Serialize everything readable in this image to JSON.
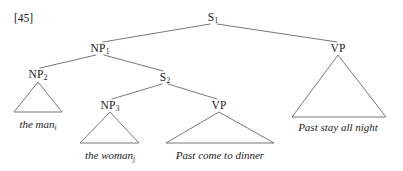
{
  "figure": {
    "example_number": "[45]",
    "caption": "",
    "line_color": "#55555a",
    "text_color": "#1a1a1a",
    "background_color": "#ffffff",
    "width": 403,
    "height": 171
  },
  "tree": {
    "type": "syntax-tree",
    "nodes": [
      {
        "id": "s1",
        "label": "S",
        "subscript": "1",
        "x": 213,
        "y": 17,
        "role": "root"
      },
      {
        "id": "np1",
        "label": "NP",
        "subscript": "1",
        "x": 100,
        "y": 48,
        "role": "branching"
      },
      {
        "id": "vp_right",
        "label": "VP",
        "subscript": "",
        "x": 338,
        "y": 48,
        "role": "triangle"
      },
      {
        "id": "np2",
        "label": "NP",
        "subscript": "2",
        "x": 38,
        "y": 74,
        "role": "triangle"
      },
      {
        "id": "s2",
        "label": "S",
        "subscript": "2",
        "x": 165,
        "y": 77,
        "role": "branching"
      },
      {
        "id": "np3",
        "label": "NP",
        "subscript": "3",
        "x": 110,
        "y": 105,
        "role": "triangle"
      },
      {
        "id": "vp_inner",
        "label": "VP",
        "subscript": "",
        "x": 219,
        "y": 105,
        "role": "triangle"
      }
    ],
    "edges": [
      {
        "from": "s1",
        "to": "np1",
        "x1": 210,
        "y1": 24,
        "x2": 103,
        "y2": 42
      },
      {
        "from": "s1",
        "to": "vp_right",
        "x1": 217,
        "y1": 24,
        "x2": 337,
        "y2": 42
      },
      {
        "from": "np1",
        "to": "np2",
        "x1": 96,
        "y1": 55,
        "x2": 40,
        "y2": 68
      },
      {
        "from": "np1",
        "to": "s2",
        "x1": 104,
        "y1": 55,
        "x2": 163,
        "y2": 71
      },
      {
        "from": "s2",
        "to": "np3",
        "x1": 162,
        "y1": 84,
        "x2": 112,
        "y2": 99
      },
      {
        "from": "s2",
        "to": "vp_inner",
        "x1": 168,
        "y1": 84,
        "x2": 217,
        "y2": 99
      }
    ],
    "triangles": [
      {
        "id": "tri_np2",
        "parent": "np2",
        "apex_x": 38,
        "apex_y": 82,
        "base_left_x": 14,
        "base_right_x": 62,
        "base_y": 112,
        "terminal": {
          "text": "the man",
          "subscript": "i",
          "x": 38,
          "y": 118
        }
      },
      {
        "id": "tri_np3",
        "parent": "np3",
        "apex_x": 110,
        "apex_y": 112,
        "base_left_x": 80,
        "base_right_x": 139,
        "base_y": 143,
        "terminal": {
          "text": "the woman",
          "subscript": "j",
          "x": 110,
          "y": 149
        }
      },
      {
        "id": "tri_vp_inner",
        "parent": "vp_inner",
        "apex_x": 219,
        "apex_y": 112,
        "base_left_x": 166,
        "base_right_x": 274,
        "base_y": 143,
        "terminal": {
          "text": "Past come to dinner",
          "subscript": "",
          "x": 220,
          "y": 149
        }
      },
      {
        "id": "tri_vp_right",
        "parent": "vp_right",
        "apex_x": 338,
        "apex_y": 55,
        "base_left_x": 292,
        "base_right_x": 386,
        "base_y": 117,
        "terminal": {
          "text": "Past stay all night",
          "subscript": "",
          "x": 338,
          "y": 121
        }
      }
    ]
  },
  "example_label": {
    "text": "[45]",
    "x": 14,
    "y": 12
  }
}
